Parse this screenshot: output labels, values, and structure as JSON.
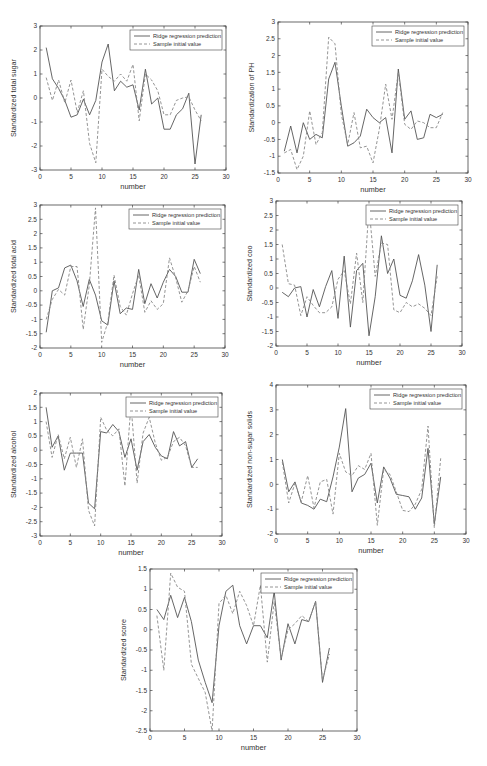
{
  "colors": {
    "axis": "#444444",
    "pred_line": "#555555",
    "sample_line": "#888888",
    "text": "#333333",
    "background": "#ffffff"
  },
  "legend": {
    "pred_label": "Ridge regression prediction",
    "sample_label": "Sample initial value"
  },
  "chart_data": [
    {
      "type": "line",
      "title": "",
      "xlabel": "number",
      "ylabel": "Standardized total sugar",
      "xlim": [
        0,
        30
      ],
      "ylim": [
        -3,
        3
      ],
      "xticks": [
        0,
        5,
        10,
        15,
        20,
        25,
        30
      ],
      "yticks": [
        -3,
        -2,
        -1,
        0,
        1,
        2,
        3
      ],
      "grid": false,
      "legend_position": "upper right",
      "x": [
        1,
        2,
        3,
        4,
        5,
        6,
        7,
        8,
        9,
        10,
        11,
        12,
        13,
        14,
        15,
        16,
        17,
        18,
        19,
        20,
        21,
        22,
        23,
        24,
        25,
        26
      ],
      "series": [
        {
          "name": "Ridge regression prediction",
          "style": "solid",
          "values": [
            2.1,
            0.8,
            0.4,
            -0.1,
            -0.8,
            -0.7,
            -0.05,
            -0.7,
            -0.1,
            1.5,
            2.25,
            0.3,
            0.7,
            0.45,
            0.55,
            -0.5,
            1.2,
            -0.25,
            0.0,
            -1.3,
            -1.3,
            -0.7,
            -0.45,
            0.2,
            -2.75,
            -0.7
          ]
        },
        {
          "name": "Sample initial value",
          "style": "dashed",
          "values": [
            0.85,
            -0.1,
            0.75,
            -0.2,
            0.75,
            -0.6,
            0.3,
            -1.9,
            -2.7,
            1.2,
            0.9,
            0.7,
            1.0,
            0.7,
            1.4,
            -0.95,
            1.0,
            0.75,
            0.3,
            -0.7,
            -0.7,
            -0.1,
            0.0,
            0.05,
            -0.5,
            -0.95
          ]
        }
      ],
      "box": {
        "left": 40,
        "top": 26,
        "width": 186,
        "height": 144
      }
    },
    {
      "type": "line",
      "title": "",
      "xlabel": "number",
      "ylabel": "Standardization of PH",
      "xlim": [
        0,
        30
      ],
      "ylim": [
        -1.5,
        3
      ],
      "xticks": [
        0,
        5,
        10,
        15,
        20,
        25,
        30
      ],
      "yticks": [
        -1.5,
        -1,
        -0.5,
        0,
        0.5,
        1,
        1.5,
        2,
        2.5,
        3
      ],
      "grid": false,
      "legend_position": "upper right",
      "x": [
        1,
        2,
        3,
        4,
        5,
        6,
        7,
        8,
        9,
        10,
        11,
        12,
        13,
        14,
        15,
        16,
        17,
        18,
        19,
        20,
        21,
        22,
        23,
        24,
        25,
        26
      ],
      "series": [
        {
          "name": "Ridge regression prediction",
          "style": "solid",
          "values": [
            -0.85,
            -0.1,
            -0.9,
            0.0,
            -0.5,
            -0.35,
            -0.45,
            1.3,
            1.8,
            0.5,
            -0.7,
            -0.6,
            -0.4,
            0.4,
            0.15,
            0.0,
            0.15,
            -0.9,
            1.6,
            0.1,
            0.35,
            -0.5,
            -0.45,
            0.25,
            0.15,
            0.25
          ]
        },
        {
          "name": "Sample initial value",
          "style": "dashed",
          "values": [
            -0.9,
            -0.8,
            -1.4,
            -1.0,
            0.35,
            -0.65,
            -0.3,
            2.55,
            2.35,
            0.25,
            -0.65,
            0.3,
            -0.75,
            -0.7,
            -1.2,
            -0.2,
            1.15,
            0.1,
            1.5,
            -0.05,
            -0.2,
            0.05,
            0.0,
            -0.15,
            -0.15,
            0.3
          ]
        }
      ],
      "box": {
        "left": 278,
        "top": 22,
        "width": 190,
        "height": 151
      }
    },
    {
      "type": "line",
      "title": "",
      "xlabel": "number",
      "ylabel": "Standardized total acid",
      "xlim": [
        0,
        30
      ],
      "ylim": [
        -2,
        3
      ],
      "xticks": [
        0,
        5,
        10,
        15,
        20,
        25,
        30
      ],
      "yticks": [
        -2,
        -1.5,
        -1,
        -0.5,
        0,
        0.5,
        1,
        1.5,
        2,
        2.5,
        3
      ],
      "grid": false,
      "legend_position": "upper right",
      "x": [
        1,
        2,
        3,
        4,
        5,
        6,
        7,
        8,
        9,
        10,
        11,
        12,
        13,
        14,
        15,
        16,
        17,
        18,
        19,
        20,
        21,
        22,
        23,
        24,
        25,
        26
      ],
      "series": [
        {
          "name": "Ridge regression prediction",
          "style": "solid",
          "values": [
            -1.45,
            0.0,
            0.1,
            0.8,
            0.9,
            0.35,
            -0.55,
            0.4,
            -0.15,
            -1.05,
            -1.2,
            0.35,
            -0.8,
            -0.6,
            -0.65,
            0.75,
            -0.45,
            0.25,
            -0.25,
            0.3,
            0.75,
            0.5,
            -0.05,
            -0.05,
            1.1,
            0.6
          ]
        },
        {
          "name": "Sample initial value",
          "style": "dashed",
          "values": [
            -1.0,
            -0.3,
            0.05,
            -0.15,
            0.85,
            0.85,
            -1.35,
            0.2,
            2.9,
            -1.8,
            -1.1,
            0.55,
            -0.55,
            -0.85,
            -0.1,
            0.55,
            -0.75,
            -0.35,
            -0.65,
            -0.45,
            1.15,
            0.45,
            -0.4,
            0.0,
            0.85,
            0.3
          ]
        }
      ],
      "box": {
        "left": 40,
        "top": 205,
        "width": 185,
        "height": 143
      }
    },
    {
      "type": "line",
      "title": "",
      "xlabel": "number",
      "ylabel": "Standardized coo",
      "xlim": [
        0,
        30
      ],
      "ylim": [
        -2,
        3
      ],
      "xticks": [
        0,
        5,
        10,
        15,
        20,
        25,
        30
      ],
      "yticks": [
        -2,
        -1.5,
        -1,
        -0.5,
        0,
        0.5,
        1,
        1.5,
        2,
        2.5,
        3
      ],
      "grid": false,
      "legend_position": "upper right",
      "x": [
        1,
        2,
        3,
        4,
        5,
        6,
        7,
        8,
        9,
        10,
        11,
        12,
        13,
        14,
        15,
        16,
        17,
        18,
        19,
        20,
        21,
        22,
        23,
        24,
        25,
        26
      ],
      "series": [
        {
          "name": "Ridge regression prediction",
          "style": "solid",
          "values": [
            -0.15,
            -0.3,
            0.0,
            0.05,
            -1.0,
            -0.05,
            -0.65,
            0.05,
            0.6,
            -1.05,
            1.1,
            -1.35,
            0.6,
            0.85,
            -1.65,
            -0.3,
            1.8,
            0.5,
            1.0,
            -0.25,
            -0.35,
            0.25,
            1.15,
            0.1,
            -1.5,
            0.8
          ]
        },
        {
          "name": "Sample initial value",
          "style": "dashed",
          "values": [
            1.5,
            0.15,
            0.1,
            -0.95,
            -0.3,
            -0.6,
            -0.85,
            -0.85,
            -0.65,
            0.3,
            0.6,
            -0.55,
            1.2,
            -0.5,
            2.8,
            0.4,
            1.55,
            1.5,
            -0.75,
            -0.85,
            -0.5,
            -0.65,
            -0.55,
            -0.7,
            -0.95,
            0.4
          ]
        }
      ],
      "box": {
        "left": 276,
        "top": 201,
        "width": 186,
        "height": 145
      }
    },
    {
      "type": "line",
      "title": "",
      "xlabel": "number",
      "ylabel": "Standardized alcohol",
      "xlim": [
        0,
        30
      ],
      "ylim": [
        -3,
        2
      ],
      "xticks": [
        0,
        5,
        10,
        15,
        20,
        25,
        30
      ],
      "yticks": [
        -3,
        -2.5,
        -2,
        -1.5,
        -1,
        -0.5,
        0,
        0.5,
        1,
        1.5,
        2
      ],
      "grid": false,
      "legend_position": "upper right",
      "x": [
        1,
        2,
        3,
        4,
        5,
        6,
        7,
        8,
        9,
        10,
        11,
        12,
        13,
        14,
        15,
        16,
        17,
        18,
        19,
        20,
        21,
        22,
        23,
        24,
        25,
        26
      ],
      "series": [
        {
          "name": "Ridge regression prediction",
          "style": "solid",
          "values": [
            1.5,
            0.1,
            0.5,
            -0.7,
            -0.1,
            -0.1,
            -0.1,
            -1.85,
            -2.05,
            0.65,
            0.6,
            0.9,
            0.65,
            -0.25,
            0.4,
            -0.7,
            0.3,
            0.55,
            0.1,
            -0.2,
            -0.3,
            0.65,
            0.15,
            0.3,
            -0.6,
            -0.3
          ]
        },
        {
          "name": "Sample initial value",
          "style": "dashed",
          "values": [
            1.0,
            -0.25,
            0.55,
            -0.3,
            0.45,
            -0.6,
            0.4,
            -2.1,
            -2.65,
            1.15,
            0.7,
            0.5,
            0.75,
            -1.25,
            1.6,
            -1.15,
            0.6,
            1.15,
            0.25,
            -0.35,
            -0.25,
            0.3,
            0.45,
            0.15,
            -0.6,
            -0.6
          ]
        }
      ],
      "box": {
        "left": 40,
        "top": 393,
        "width": 182,
        "height": 143
      }
    },
    {
      "type": "line",
      "title": "",
      "xlabel": "number",
      "ylabel": "Standardized non-sugar solids",
      "xlim": [
        0,
        30
      ],
      "ylim": [
        -2,
        4
      ],
      "xticks": [
        0,
        5,
        10,
        15,
        20,
        25,
        30
      ],
      "yticks": [
        -2,
        -1,
        0,
        1,
        2,
        3,
        4
      ],
      "grid": false,
      "legend_position": "upper right",
      "x": [
        1,
        2,
        3,
        4,
        5,
        6,
        7,
        8,
        9,
        10,
        11,
        12,
        13,
        14,
        15,
        16,
        17,
        18,
        19,
        20,
        21,
        22,
        23,
        24,
        25,
        26
      ],
      "series": [
        {
          "name": "Ridge regression prediction",
          "style": "solid",
          "values": [
            1.0,
            -0.3,
            0.1,
            -0.75,
            -0.85,
            -1.0,
            -0.6,
            -0.7,
            0.3,
            1.5,
            3.05,
            -0.3,
            0.25,
            0.4,
            0.85,
            -0.75,
            0.7,
            0.25,
            -0.4,
            -0.45,
            -0.5,
            -1.0,
            -0.55,
            1.45,
            -1.6,
            0.3
          ]
        },
        {
          "name": "Sample initial value",
          "style": "dashed",
          "values": [
            0.9,
            -0.75,
            0.05,
            -0.7,
            0.35,
            -0.95,
            0.1,
            0.2,
            -1.2,
            1.25,
            0.5,
            0.35,
            0.75,
            0.6,
            1.25,
            -1.65,
            0.6,
            0.4,
            -0.3,
            -1.05,
            -1.1,
            -0.8,
            -0.2,
            2.35,
            -1.75,
            1.05
          ]
        }
      ],
      "box": {
        "left": 276,
        "top": 385,
        "width": 190,
        "height": 149
      }
    },
    {
      "type": "line",
      "title": "",
      "xlabel": "number",
      "ylabel": "Standardized score",
      "xlim": [
        0,
        30
      ],
      "ylim": [
        -2.5,
        1.5
      ],
      "xticks": [
        0,
        5,
        10,
        15,
        20,
        25,
        30
      ],
      "yticks": [
        -2.5,
        -2,
        -1.5,
        -1,
        -0.5,
        0,
        0.5,
        1,
        1.5
      ],
      "grid": false,
      "legend_position": "upper right",
      "x": [
        1,
        2,
        3,
        4,
        5,
        6,
        7,
        8,
        9,
        10,
        11,
        12,
        13,
        14,
        15,
        16,
        17,
        18,
        19,
        20,
        21,
        22,
        23,
        24,
        25,
        26
      ],
      "series": [
        {
          "name": "Ridge regression prediction",
          "style": "solid",
          "values": [
            0.5,
            0.25,
            0.85,
            0.3,
            0.8,
            0.2,
            -0.75,
            -1.3,
            -1.8,
            0.1,
            0.95,
            1.1,
            0.1,
            -0.35,
            0.1,
            0.1,
            -0.2,
            0.95,
            -0.75,
            0.15,
            -0.35,
            0.25,
            0.2,
            0.7,
            -1.3,
            -0.45
          ]
        },
        {
          "name": "Sample initial value",
          "style": "dashed",
          "values": [
            0.35,
            -1.0,
            1.4,
            1.05,
            0.95,
            -0.85,
            -1.2,
            -1.55,
            -2.5,
            0.65,
            0.85,
            0.4,
            0.95,
            0.6,
            0.1,
            1.1,
            -0.8,
            0.7,
            -0.7,
            0.0,
            0.15,
            0.35,
            0.2,
            0.7,
            -1.25,
            -0.6
          ]
        }
      ],
      "box": {
        "left": 150,
        "top": 569,
        "width": 207,
        "height": 162
      }
    }
  ]
}
